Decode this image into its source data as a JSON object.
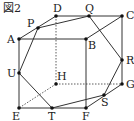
{
  "figure": {
    "title": "図2",
    "vertices": {
      "A": [
        19,
        39
      ],
      "B": [
        86,
        39
      ],
      "C": [
        122,
        16
      ],
      "D": [
        56,
        16
      ],
      "E": [
        19,
        108
      ],
      "F": [
        86,
        108
      ],
      "G": [
        122,
        84
      ],
      "H": [
        56,
        84
      ],
      "P": [
        38,
        28
      ],
      "Q": [
        89,
        16
      ],
      "R": [
        122,
        60
      ],
      "S": [
        104,
        95
      ],
      "T": [
        52,
        108
      ],
      "U": [
        19,
        73
      ]
    },
    "labels": {
      "A": "A",
      "B": "B",
      "C": "C",
      "D": "D",
      "E": "E",
      "F": "F",
      "G": "G",
      "H": "H",
      "P": "P",
      "Q": "Q",
      "R": "R",
      "S": "S",
      "T": "T",
      "U": "U"
    },
    "solid_edges": [
      [
        "A",
        "B"
      ],
      [
        "B",
        "C"
      ],
      [
        "C",
        "D"
      ],
      [
        "D",
        "A"
      ],
      [
        "E",
        "F"
      ],
      [
        "F",
        "G"
      ],
      [
        "A",
        "E"
      ],
      [
        "B",
        "F"
      ],
      [
        "C",
        "G"
      ]
    ],
    "hidden_edges": [
      [
        "D",
        "H"
      ],
      [
        "H",
        "E"
      ],
      [
        "H",
        "G"
      ]
    ],
    "section_edges": [
      [
        "P",
        "Q"
      ],
      [
        "Q",
        "R"
      ],
      [
        "R",
        "S"
      ],
      [
        "S",
        "T"
      ],
      [
        "T",
        "U"
      ],
      [
        "U",
        "P"
      ]
    ],
    "colors": {
      "line": "#333333",
      "dot": "#111111"
    }
  }
}
